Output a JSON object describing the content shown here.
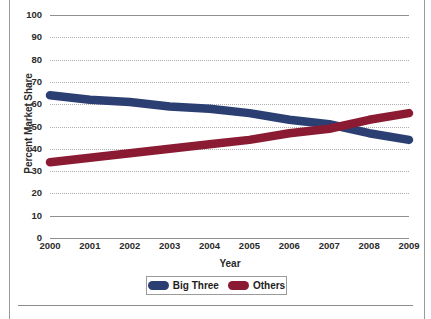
{
  "chart_data": {
    "type": "line",
    "title": "",
    "xlabel": "Year",
    "ylabel": "Percent Market Share",
    "x": [
      2000,
      2001,
      2002,
      2003,
      2004,
      2005,
      2006,
      2007,
      2008,
      2009
    ],
    "categories": [
      "2000",
      "2001",
      "2002",
      "2003",
      "2004",
      "2005",
      "2006",
      "2007",
      "2008",
      "2009"
    ],
    "series": [
      {
        "name": "Big Three",
        "color": "#2c3f73",
        "values": [
          64,
          62,
          61,
          59,
          58,
          56,
          53,
          51,
          47,
          44
        ]
      },
      {
        "name": "Others",
        "color": "#8b1b33",
        "values": [
          34,
          36,
          38,
          40,
          42,
          44,
          47,
          49,
          53,
          56
        ]
      }
    ],
    "ylim": [
      0,
      100
    ],
    "ytick_values": [
      0,
      10,
      20,
      30,
      40,
      50,
      60,
      70,
      80,
      90,
      100
    ],
    "ytick_labels": [
      "0",
      "10",
      "20",
      "30",
      "40",
      "50",
      "60",
      "70",
      "80",
      "90",
      "100"
    ],
    "xlim": [
      2000,
      2009
    ],
    "grid": true,
    "grid_style": "dotted-horizontal",
    "legend_position": "bottom-center"
  },
  "axes": {
    "y_title": "Percent Market Share",
    "x_title": "Year"
  },
  "legend": {
    "entries": [
      {
        "label": "Big Three",
        "color": "#2c3f73"
      },
      {
        "label": "Others",
        "color": "#8b1b33"
      }
    ]
  },
  "colors": {
    "series_blue": "#2c3f73",
    "series_red": "#8b1b33",
    "gridline": "#aeaeae",
    "axis": "#8f8f8f",
    "text": "#2b2b2b",
    "page_border": "#9a9a9a"
  }
}
